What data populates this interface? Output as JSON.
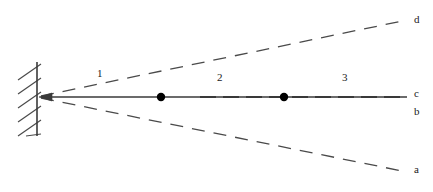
{
  "figure": {
    "type": "ray-diagram",
    "background_color": "#ffffff",
    "line_color": "#3a3a3a",
    "dot_color": "#000000",
    "label_color": "#1a1a1a",
    "width": 433,
    "height": 192,
    "wall": {
      "name": "fixed-wall",
      "x": 37,
      "y_top": 62,
      "y_bottom": 136,
      "hatch_count": 6,
      "hatch_length": 22
    },
    "origin": {
      "name": "convergence-point",
      "x": 40,
      "y": 97,
      "arrowhead": "left"
    },
    "rays": [
      {
        "id": "d",
        "label": "d",
        "style": "dashed",
        "end_x": 407,
        "end_y": 20,
        "label_x": 414,
        "label_y": 15
      },
      {
        "id": "c",
        "label": "c",
        "style": "solid",
        "end_x": 407,
        "end_y": 97,
        "label_x": 414,
        "label_y": 88
      },
      {
        "id": "b",
        "label": "b",
        "style": "none",
        "end_x": 407,
        "end_y": 97,
        "label_x": 414,
        "label_y": 107
      },
      {
        "id": "a",
        "label": "a",
        "style": "dashed",
        "end_x": 407,
        "end_y": 172,
        "label_x": 414,
        "label_y": 165
      }
    ],
    "dots": [
      {
        "name": "node-1",
        "x": 161,
        "y": 97,
        "r": 4
      },
      {
        "name": "node-2",
        "x": 284,
        "y": 97,
        "r": 4
      }
    ],
    "regions": [
      {
        "id": "1",
        "label": "1",
        "x": 99,
        "y": 73
      },
      {
        "id": "2",
        "label": "2",
        "x": 219,
        "y": 77
      },
      {
        "id": "3",
        "label": "3",
        "x": 344,
        "y": 77
      }
    ]
  }
}
